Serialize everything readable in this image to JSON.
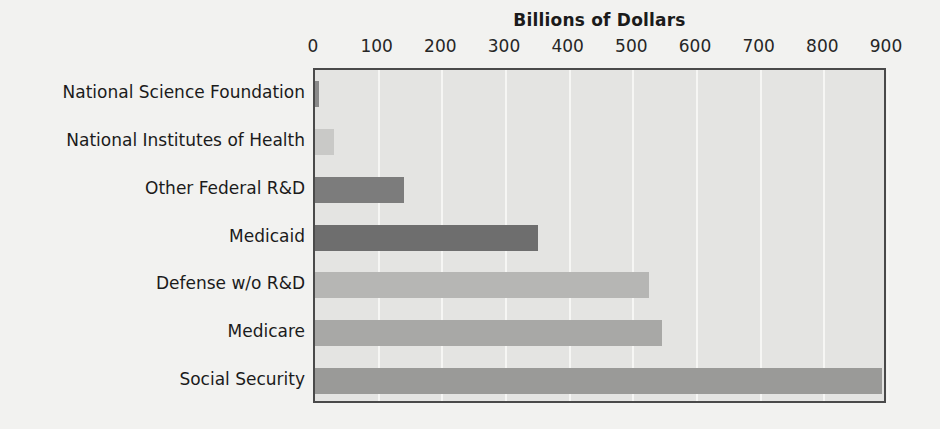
{
  "chart_data": {
    "type": "bar",
    "orientation": "horizontal",
    "title": "Billions of Dollars",
    "xlabel": "",
    "ylabel": "",
    "xlim": [
      0,
      900
    ],
    "xticks": [
      0,
      100,
      200,
      300,
      400,
      500,
      600,
      700,
      800,
      900
    ],
    "xtick_labels": [
      "0",
      "100",
      "200",
      "300",
      "400",
      "500",
      "600",
      "700",
      "800",
      "900"
    ],
    "grid": true,
    "grid_axis": "x",
    "legend": "none",
    "categories": [
      "National Science Foundation",
      "National Institutes of Health",
      "Other Federal R&D",
      "Medicaid",
      "Defense w/o R&D",
      "Medicare",
      "Social Security"
    ],
    "values": [
      7,
      30,
      140,
      350,
      525,
      545,
      890
    ],
    "bar_colors": [
      "#8a8a8a",
      "#c9c9c7",
      "#7c7c7c",
      "#6e6e6e",
      "#b6b6b4",
      "#a8a8a6",
      "#9a9a98"
    ]
  },
  "style": {
    "page_background": "#f2f2f0",
    "plot_background": "#e4e4e2",
    "plot_border": "#4a4a4a",
    "gridline_color": "#f6f6f4",
    "text_color": "#1b1b1b"
  }
}
